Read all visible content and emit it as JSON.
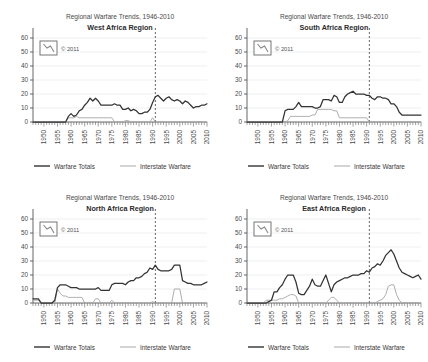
{
  "common": {
    "title_line1": "Regional Warfare Trends, 1946-2010",
    "copyright": "© 2011",
    "logo_name": "csp-logo",
    "legend": [
      {
        "label": "Warfare Totals",
        "color": "#333333",
        "width": 1.2
      },
      {
        "label": "Interstate Warfare",
        "color": "#aaaaaa",
        "width": 1.0
      }
    ],
    "ytick_labels": [
      "0",
      "10",
      "20",
      "30",
      "40",
      "50",
      "60"
    ],
    "xtick_labels": [
      "1950",
      "1955",
      "1960",
      "1965",
      "1970",
      "1975",
      "1980",
      "1985",
      "1990",
      "1995",
      "2000",
      "2005",
      "2010"
    ],
    "marker_year": 1991,
    "axis_color": "#555555",
    "grid_color": "#dfe4ea"
  },
  "chart_data": [
    {
      "type": "line",
      "panel": "top-left",
      "title": "Regional Warfare Trends, 1946-2010",
      "subtitle": "West Africa Region",
      "xlabel": "",
      "ylabel": "",
      "xlim": [
        1946,
        2010
      ],
      "ylim": [
        0,
        60
      ],
      "yticks": [
        0,
        10,
        20,
        30,
        40,
        50,
        60
      ],
      "xticks": [
        1950,
        1955,
        1960,
        1965,
        1970,
        1975,
        1980,
        1985,
        1990,
        1995,
        2000,
        2005,
        2010
      ],
      "grid": true,
      "legend_position": "bottom",
      "annotations": [
        {
          "type": "vline",
          "x": 1991,
          "style": "dashed"
        }
      ],
      "x": [
        1946,
        1947,
        1948,
        1949,
        1950,
        1951,
        1952,
        1953,
        1954,
        1955,
        1956,
        1957,
        1958,
        1959,
        1960,
        1961,
        1962,
        1963,
        1964,
        1965,
        1966,
        1967,
        1968,
        1969,
        1970,
        1971,
        1972,
        1973,
        1974,
        1975,
        1976,
        1977,
        1978,
        1979,
        1980,
        1981,
        1982,
        1983,
        1984,
        1985,
        1986,
        1987,
        1988,
        1989,
        1990,
        1991,
        1992,
        1993,
        1994,
        1995,
        1996,
        1997,
        1998,
        1999,
        2000,
        2001,
        2002,
        2003,
        2004,
        2005,
        2006,
        2007,
        2008,
        2009,
        2010
      ],
      "series": [
        {
          "name": "Warfare Totals",
          "color": "#333333",
          "values": [
            0,
            0,
            0,
            0,
            0,
            0,
            0,
            0,
            0,
            0,
            0,
            0,
            0,
            4,
            6,
            4,
            5,
            8,
            9,
            12,
            14,
            17,
            15,
            17,
            15,
            12,
            12,
            12,
            12,
            12,
            13,
            12,
            12,
            9,
            9,
            10,
            8,
            9,
            8,
            6,
            6,
            7,
            7,
            9,
            14,
            18,
            19,
            17,
            15,
            17,
            18,
            16,
            15,
            16,
            15,
            13,
            15,
            14,
            12,
            10,
            11,
            11,
            12,
            12,
            13
          ]
        },
        {
          "name": "Interstate Warfare",
          "color": "#aaaaaa",
          "values": [
            0,
            0,
            0,
            0,
            0,
            0,
            0,
            0,
            0,
            0,
            0,
            0,
            0,
            3,
            3,
            3,
            4,
            3,
            3,
            3,
            3,
            3,
            3,
            3,
            3,
            3,
            3,
            3,
            3,
            3,
            0,
            0,
            0,
            0,
            1,
            1,
            0,
            0,
            0,
            0,
            0,
            0,
            0,
            0,
            3,
            0,
            0,
            0,
            0,
            0,
            0,
            0,
            0,
            0,
            0,
            0,
            0,
            0,
            0,
            0,
            0,
            0,
            0,
            0,
            0
          ]
        }
      ]
    },
    {
      "type": "line",
      "panel": "top-right",
      "title": "Regional Warfare Trends, 1946-2010",
      "subtitle": "South Africa Region",
      "xlabel": "",
      "ylabel": "",
      "xlim": [
        1946,
        2010
      ],
      "ylim": [
        0,
        60
      ],
      "yticks": [
        0,
        10,
        20,
        30,
        40,
        50,
        60
      ],
      "xticks": [
        1950,
        1955,
        1960,
        1965,
        1970,
        1975,
        1980,
        1985,
        1990,
        1995,
        2000,
        2005,
        2010
      ],
      "grid": true,
      "legend_position": "bottom",
      "annotations": [
        {
          "type": "vline",
          "x": 1991,
          "style": "dashed"
        }
      ],
      "x": [
        1946,
        1947,
        1948,
        1949,
        1950,
        1951,
        1952,
        1953,
        1954,
        1955,
        1956,
        1957,
        1958,
        1959,
        1960,
        1961,
        1962,
        1963,
        1964,
        1965,
        1966,
        1967,
        1968,
        1969,
        1970,
        1971,
        1972,
        1973,
        1974,
        1975,
        1976,
        1977,
        1978,
        1979,
        1980,
        1981,
        1982,
        1983,
        1984,
        1985,
        1986,
        1987,
        1988,
        1989,
        1990,
        1991,
        1992,
        1993,
        1994,
        1995,
        1996,
        1997,
        1998,
        1999,
        2000,
        2001,
        2002,
        2003,
        2004,
        2005,
        2006,
        2007,
        2008,
        2009,
        2010
      ],
      "series": [
        {
          "name": "Warfare Totals",
          "color": "#333333",
          "values": [
            0,
            0,
            0,
            0,
            0,
            0,
            0,
            0,
            0,
            0,
            0,
            0,
            0,
            0,
            8,
            9,
            9,
            9,
            11,
            14,
            11,
            11,
            11,
            11,
            11,
            10,
            10,
            11,
            16,
            16,
            16,
            15,
            19,
            18,
            14,
            14,
            18,
            20,
            21,
            22,
            20,
            20,
            20,
            20,
            19,
            19,
            17,
            16,
            18,
            18,
            17,
            17,
            16,
            13,
            13,
            11,
            7,
            5,
            5,
            5,
            5,
            5,
            5,
            5,
            5
          ]
        },
        {
          "name": "Interstate Warfare",
          "color": "#aaaaaa",
          "values": [
            0,
            0,
            0,
            0,
            0,
            0,
            0,
            0,
            0,
            0,
            0,
            0,
            0,
            0,
            0,
            1,
            4,
            4,
            4,
            4,
            4,
            4,
            4,
            4,
            5,
            5,
            9,
            9,
            9,
            9,
            9,
            9,
            8,
            8,
            3,
            3,
            3,
            3,
            3,
            3,
            3,
            3,
            3,
            3,
            3,
            0,
            0,
            0,
            0,
            0,
            0,
            0,
            0,
            0,
            0,
            0,
            0,
            0,
            0,
            0,
            0,
            0,
            0,
            0,
            0
          ]
        }
      ]
    },
    {
      "type": "line",
      "panel": "bottom-left",
      "title": "Regional Warfare Trends, 1946-2010",
      "subtitle": "North Africa Region",
      "xlabel": "",
      "ylabel": "",
      "xlim": [
        1946,
        2010
      ],
      "ylim": [
        0,
        60
      ],
      "yticks": [
        0,
        10,
        20,
        30,
        40,
        50,
        60
      ],
      "xticks": [
        1950,
        1955,
        1960,
        1965,
        1970,
        1975,
        1980,
        1985,
        1990,
        1995,
        2000,
        2005,
        2010
      ],
      "grid": true,
      "legend_position": "bottom",
      "annotations": [
        {
          "type": "vline",
          "x": 1991,
          "style": "dashed"
        }
      ],
      "x": [
        1946,
        1947,
        1948,
        1949,
        1950,
        1951,
        1952,
        1953,
        1954,
        1955,
        1956,
        1957,
        1958,
        1959,
        1960,
        1961,
        1962,
        1963,
        1964,
        1965,
        1966,
        1967,
        1968,
        1969,
        1970,
        1971,
        1972,
        1973,
        1974,
        1975,
        1976,
        1977,
        1978,
        1979,
        1980,
        1981,
        1982,
        1983,
        1984,
        1985,
        1986,
        1987,
        1988,
        1989,
        1990,
        1991,
        1992,
        1993,
        1994,
        1995,
        1996,
        1997,
        1998,
        1999,
        2000,
        2001,
        2002,
        2003,
        2004,
        2005,
        2006,
        2007,
        2008,
        2009,
        2010
      ],
      "series": [
        {
          "name": "Warfare Totals",
          "color": "#333333",
          "values": [
            3,
            3,
            3,
            0,
            0,
            0,
            0,
            0,
            2,
            11,
            13,
            13,
            13,
            12,
            11,
            11,
            11,
            10,
            10,
            10,
            10,
            10,
            10,
            10,
            11,
            9,
            9,
            9,
            9,
            13,
            14,
            14,
            14,
            14,
            13,
            15,
            16,
            16,
            18,
            18,
            19,
            21,
            22,
            25,
            24,
            27,
            24,
            23,
            23,
            23,
            23,
            24,
            27,
            27,
            27,
            16,
            15,
            14,
            14,
            13,
            13,
            13,
            13,
            14,
            15
          ]
        },
        {
          "name": "Interstate Warfare",
          "color": "#aaaaaa",
          "values": [
            2,
            2,
            2,
            0,
            0,
            0,
            0,
            0,
            0,
            10,
            7,
            5,
            5,
            4,
            4,
            4,
            4,
            4,
            4,
            0,
            0,
            0,
            0,
            3,
            3,
            0,
            0,
            0,
            0,
            2,
            0,
            0,
            0,
            0,
            0,
            0,
            0,
            0,
            0,
            0,
            0,
            0,
            0,
            0,
            1,
            0,
            0,
            0,
            0,
            0,
            0,
            0,
            10,
            10,
            10,
            0,
            0,
            0,
            0,
            0,
            0,
            0,
            0,
            0,
            0
          ]
        }
      ]
    },
    {
      "type": "line",
      "panel": "bottom-right",
      "title": "Regional Warfare Trends, 1946-2010",
      "subtitle": "East Africa Region",
      "xlabel": "",
      "ylabel": "",
      "xlim": [
        1946,
        2010
      ],
      "ylim": [
        0,
        60
      ],
      "yticks": [
        0,
        10,
        20,
        30,
        40,
        50,
        60
      ],
      "xticks": [
        1950,
        1955,
        1960,
        1965,
        1970,
        1975,
        1980,
        1985,
        1990,
        1995,
        2000,
        2005,
        2010
      ],
      "grid": true,
      "legend_position": "bottom",
      "annotations": [
        {
          "type": "vline",
          "x": 1991,
          "style": "dashed"
        }
      ],
      "x": [
        1946,
        1947,
        1948,
        1949,
        1950,
        1951,
        1952,
        1953,
        1954,
        1955,
        1956,
        1957,
        1958,
        1959,
        1960,
        1961,
        1962,
        1963,
        1964,
        1965,
        1966,
        1967,
        1968,
        1969,
        1970,
        1971,
        1972,
        1973,
        1974,
        1975,
        1976,
        1977,
        1978,
        1979,
        1980,
        1981,
        1982,
        1983,
        1984,
        1985,
        1986,
        1987,
        1988,
        1989,
        1990,
        1991,
        1992,
        1993,
        1994,
        1995,
        1996,
        1997,
        1998,
        1999,
        2000,
        2001,
        2002,
        2003,
        2004,
        2005,
        2006,
        2007,
        2008,
        2009,
        2010
      ],
      "series": [
        {
          "name": "Warfare Totals",
          "color": "#333333",
          "values": [
            0,
            0,
            0,
            0,
            0,
            0,
            0,
            0,
            1,
            2,
            8,
            8,
            11,
            13,
            17,
            20,
            20,
            20,
            15,
            7,
            6,
            6,
            9,
            12,
            17,
            13,
            12,
            12,
            16,
            20,
            14,
            8,
            13,
            15,
            16,
            17,
            18,
            18,
            19,
            20,
            20,
            20,
            21,
            21,
            23,
            22,
            25,
            26,
            28,
            27,
            30,
            34,
            36,
            38,
            35,
            30,
            25,
            22,
            21,
            20,
            19,
            18,
            19,
            20,
            17
          ]
        },
        {
          "name": "Interstate Warfare",
          "color": "#aaaaaa",
          "values": [
            0,
            0,
            0,
            0,
            0,
            0,
            0,
            2,
            2,
            2,
            2,
            2,
            3,
            3,
            4,
            5,
            6,
            6,
            5,
            0,
            0,
            0,
            0,
            0,
            0,
            0,
            0,
            0,
            0,
            0,
            2,
            4,
            4,
            2,
            0,
            0,
            0,
            0,
            0,
            0,
            0,
            0,
            0,
            0,
            0,
            0,
            0,
            0,
            1,
            2,
            3,
            6,
            12,
            13,
            13,
            6,
            2,
            0,
            0,
            0,
            0,
            0,
            0,
            0,
            0
          ]
        }
      ]
    }
  ]
}
